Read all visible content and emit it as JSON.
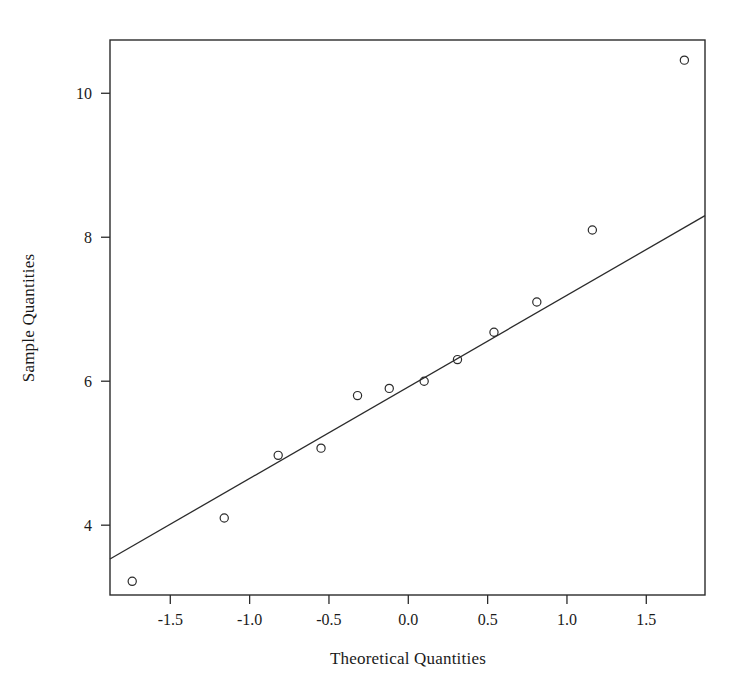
{
  "chart_data": {
    "type": "scatter",
    "title": "",
    "xlabel": "Theoretical Quantities",
    "ylabel": "Sample Quantities",
    "xlim": [
      -1.88,
      1.87
    ],
    "ylim": [
      3.03,
      10.74
    ],
    "grid": false,
    "legend": null,
    "xticks": [
      -1.5,
      -1.0,
      -0.5,
      0.0,
      0.5,
      1.0,
      1.5
    ],
    "xticklabels": [
      "-1.5",
      "-1.0",
      "-0.5",
      "0.0",
      "0.5",
      "1.0",
      "1.5"
    ],
    "yticks": [
      10,
      8,
      6,
      4
    ],
    "yticklabels": [
      "10",
      "8",
      "6",
      "4"
    ],
    "series": [
      {
        "name": "sample-quantiles",
        "marker": "open-circle",
        "x": [
          -1.74,
          -1.16,
          -0.82,
          -0.55,
          -0.32,
          -0.12,
          0.1,
          0.31,
          0.54,
          0.81,
          1.16,
          1.74
        ],
        "y": [
          3.22,
          4.1,
          4.97,
          5.07,
          5.8,
          5.9,
          6.0,
          6.3,
          6.68,
          7.1,
          8.1,
          10.46
        ]
      }
    ],
    "reference_line": {
      "name": "qq-reference-line",
      "x": [
        -1.88,
        1.87
      ],
      "y": [
        3.53,
        8.3
      ]
    }
  },
  "axes": {
    "x_axis_label": "Theoretical Quantities",
    "y_axis_label": "Sample Quantities"
  }
}
